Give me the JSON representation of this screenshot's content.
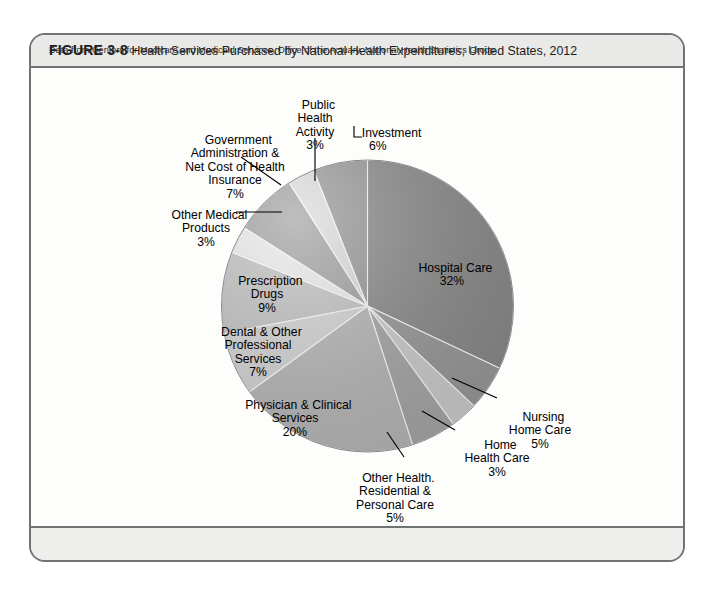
{
  "figure": {
    "number": "FIGURE 3-8",
    "title": "Health Services Purchased by National Health Expenditures, United States, 2012",
    "source_note": "Data from Centers for Medicare and Medicaid Services, Office of the Actuary, National Health Statistics Group."
  },
  "chart_data": {
    "type": "pie",
    "title": "Health Services Purchased by National Health Expenditures, United States, 2012",
    "unit": "percent",
    "total": 100,
    "start_angle_deg": 0,
    "direction": "clockwise",
    "legend": "none",
    "labels_inside_and_outside": true,
    "categories": [
      "Hospital Care",
      "Nursing Home Care",
      "Home Health Care",
      "Other Health. Residential & Personal Care",
      "Physician & Clinical Services",
      "Dental & Other Professional Services",
      "Prescription Drugs",
      "Other Medical Products",
      "Government Administration & Net Cost of Health Insurance",
      "Public Health Activity",
      "Investment"
    ],
    "values": [
      32,
      5,
      3,
      5,
      20,
      7,
      9,
      3,
      7,
      3,
      6
    ],
    "value_labels": [
      "32%",
      "5%",
      "3%",
      "5%",
      "20%",
      "7%",
      "9%",
      "3%",
      "7%",
      "3%",
      "6%"
    ],
    "colors": [
      "#8b8b8b",
      "#9a9a9a",
      "#cfcfcf",
      "#a8a8a8",
      "#b9b9b9",
      "#d6d6d6",
      "#c4c4c4",
      "#ededed",
      "#a3a3a3",
      "#dedede",
      "#999999"
    ]
  },
  "slices": [
    {
      "name": "Hospital Care",
      "pct": "32%",
      "line1": "Hospital Care",
      "line2": "",
      "line3": "",
      "line4": ""
    },
    {
      "name": "Nursing Home Care",
      "pct": "5%",
      "line1": "Nursing",
      "line2": "Home Care",
      "line3": "",
      "line4": ""
    },
    {
      "name": "Home Health Care",
      "pct": "3%",
      "line1": "Home",
      "line2": "Health Care",
      "line3": "",
      "line4": ""
    },
    {
      "name": "Other Health Residential",
      "pct": "5%",
      "line1": "Other Health.",
      "line2": "Residential &",
      "line3": "Personal Care",
      "line4": ""
    },
    {
      "name": "Physician Clinical",
      "pct": "20%",
      "line1": "Physician & Clinical",
      "line2": "Services",
      "line3": "",
      "line4": ""
    },
    {
      "name": "Dental Professional",
      "pct": "7%",
      "line1": "Dental & Other",
      "line2": "Professional",
      "line3": "Services",
      "line4": ""
    },
    {
      "name": "Prescription Drugs",
      "pct": "9%",
      "line1": "Prescription",
      "line2": "Drugs",
      "line3": "",
      "line4": ""
    },
    {
      "name": "Other Medical Products",
      "pct": "3%",
      "line1": "Other Medical",
      "line2": "Products",
      "line3": "",
      "line4": ""
    },
    {
      "name": "Government Administration",
      "pct": "7%",
      "line1": "Government",
      "line2": "Administration &",
      "line3": "Net Cost of Health",
      "line4": "Insurance"
    },
    {
      "name": "Public Health Activity",
      "pct": "3%",
      "line1": "Public",
      "line2": "Health",
      "line3": "Activity",
      "line4": ""
    },
    {
      "name": "Investment",
      "pct": "6%",
      "line1": "Investment",
      "line2": "",
      "line3": "",
      "line4": ""
    }
  ]
}
